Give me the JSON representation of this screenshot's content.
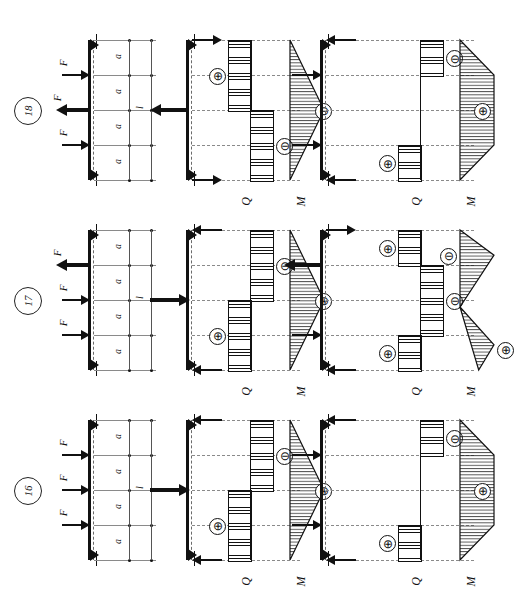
{
  "figure": {
    "orientation_deg": -90,
    "dimension_label_a": "a",
    "dimension_label_l": "l",
    "force_label": "F",
    "shear_axis_label": "Q",
    "moment_axis_label": "M",
    "sign_positive": "⊕",
    "sign_negative": "⊖"
  },
  "rows": [
    {
      "id": "case-18",
      "label": "18",
      "loading": {
        "spans": [
          "a",
          "a",
          "a",
          "a"
        ],
        "total": "l",
        "forces": [
          {
            "label": "F",
            "dir": "right",
            "weight": "normal",
            "pos": 0.25
          },
          {
            "label": "F",
            "dir": "left",
            "weight": "bold",
            "pos": 0.5
          },
          {
            "label": "F",
            "dir": "right",
            "weight": "normal",
            "pos": 0.75
          }
        ]
      },
      "panel_mid": {
        "reactions": [
          {
            "dir": "right",
            "weight": "normal",
            "pos": 0.0
          },
          {
            "dir": "left",
            "weight": "bold",
            "pos": 0.5
          },
          {
            "dir": "right",
            "weight": "normal",
            "pos": 1.0
          }
        ],
        "Q": [
          {
            "sign": "⊕",
            "from": 0.0,
            "to": 0.5,
            "side": "pos"
          },
          {
            "sign": "⊖",
            "from": 0.5,
            "to": 1.0,
            "side": "neg"
          }
        ],
        "M": {
          "shape": "triangle",
          "peak_at": 0.5,
          "sign": "⊖"
        },
        "Q_label": "Q",
        "M_label": "M"
      },
      "panel_right": {
        "reactions": [
          {
            "dir": "left",
            "weight": "normal",
            "pos": 0.0
          },
          {
            "dir": "right",
            "weight": "normal",
            "pos": 0.25
          },
          {
            "dir": "right",
            "weight": "normal",
            "pos": 0.75
          },
          {
            "dir": "left",
            "weight": "normal",
            "pos": 1.0
          }
        ],
        "Q": [
          {
            "sign": "⊖",
            "from": 0.0,
            "to": 0.25,
            "side": "neg"
          },
          {
            "sign": "⊕",
            "from": 0.75,
            "to": 1.0,
            "side": "pos"
          }
        ],
        "M": {
          "shape": "trapezoid",
          "flat_from": 0.25,
          "flat_to": 0.75,
          "sign": "⊕"
        },
        "Q_label": "Q",
        "M_label": "M"
      }
    },
    {
      "id": "case-17",
      "label": "17",
      "loading": {
        "spans": [
          "a",
          "a",
          "a",
          "a"
        ],
        "total": "l",
        "forces": [
          {
            "label": "F",
            "dir": "left",
            "weight": "bold",
            "pos": 0.25
          },
          {
            "label": "F",
            "dir": "right",
            "weight": "normal",
            "pos": 0.5
          },
          {
            "label": "F",
            "dir": "right",
            "weight": "normal",
            "pos": 0.75
          }
        ]
      },
      "panel_mid": {
        "reactions": [
          {
            "dir": "left",
            "weight": "normal",
            "pos": 0.0
          },
          {
            "dir": "right",
            "weight": "bold",
            "pos": 0.5
          },
          {
            "dir": "left",
            "weight": "normal",
            "pos": 1.0
          }
        ],
        "Q": [
          {
            "sign": "⊖",
            "from": 0.0,
            "to": 0.5,
            "side": "neg"
          },
          {
            "sign": "⊕",
            "from": 0.5,
            "to": 1.0,
            "side": "pos"
          }
        ],
        "M": {
          "shape": "triangle",
          "peak_at": 0.5,
          "sign": "⊕"
        },
        "Q_label": "Q",
        "M_label": "M"
      },
      "panel_right": {
        "reactions": [
          {
            "dir": "right",
            "weight": "normal",
            "pos": 0.0
          },
          {
            "dir": "left",
            "weight": "bold",
            "pos": 0.25
          },
          {
            "dir": "right",
            "weight": "normal",
            "pos": 0.75
          },
          {
            "dir": "left",
            "weight": "normal",
            "pos": 1.0
          }
        ],
        "Q": [
          {
            "sign": "⊕",
            "from": 0.0,
            "to": 0.25,
            "side": "pos"
          },
          {
            "sign": "⊖",
            "from": 0.25,
            "to": 0.75,
            "side": "neg"
          },
          {
            "sign": "⊕",
            "from": 0.75,
            "to": 1.0,
            "side": "pos"
          }
        ],
        "M": {
          "shape": "s-curve",
          "sign_top": "⊖",
          "sign_bottom": "⊕"
        },
        "Q_label": "Q",
        "M_label": "M"
      }
    },
    {
      "id": "case-16",
      "label": "16",
      "loading": {
        "spans": [
          "a",
          "a",
          "a",
          "a"
        ],
        "total": "l",
        "forces": [
          {
            "label": "F",
            "dir": "right",
            "weight": "normal",
            "pos": 0.25
          },
          {
            "label": "F",
            "dir": "right",
            "weight": "normal",
            "pos": 0.5
          },
          {
            "label": "F",
            "dir": "right",
            "weight": "normal",
            "pos": 0.75
          }
        ]
      },
      "panel_mid": {
        "reactions": [
          {
            "dir": "left",
            "weight": "normal",
            "pos": 0.0
          },
          {
            "dir": "right",
            "weight": "bold",
            "pos": 0.5
          },
          {
            "dir": "left",
            "weight": "normal",
            "pos": 1.0
          }
        ],
        "Q": [
          {
            "sign": "⊖",
            "from": 0.0,
            "to": 0.5,
            "side": "neg"
          },
          {
            "sign": "⊕",
            "from": 0.5,
            "to": 1.0,
            "side": "pos"
          }
        ],
        "M": {
          "shape": "triangle",
          "peak_at": 0.5,
          "sign": "⊕"
        },
        "Q_label": "Q",
        "M_label": "M"
      },
      "panel_right": {
        "reactions": [
          {
            "dir": "left",
            "weight": "normal",
            "pos": 0.0
          },
          {
            "dir": "right",
            "weight": "normal",
            "pos": 0.25
          },
          {
            "dir": "right",
            "weight": "normal",
            "pos": 0.75
          },
          {
            "dir": "left",
            "weight": "normal",
            "pos": 1.0
          }
        ],
        "Q": [
          {
            "sign": "⊖",
            "from": 0.0,
            "to": 0.25,
            "side": "neg"
          },
          {
            "sign": "⊕",
            "from": 0.75,
            "to": 1.0,
            "side": "pos"
          }
        ],
        "M": {
          "shape": "trapezoid",
          "flat_from": 0.25,
          "flat_to": 0.75,
          "sign": "⊕"
        },
        "Q_label": "Q",
        "M_label": "M"
      }
    }
  ]
}
